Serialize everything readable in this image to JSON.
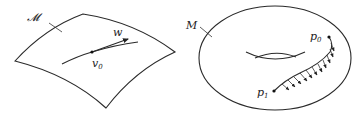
{
  "figure_left": {
    "surface_label": "𝓜",
    "point_label": "v",
    "point_subscript": "0",
    "vector_label": "w"
  },
  "figure_right": {
    "surface_label": "M",
    "start_point_label": "p",
    "start_point_subscript": "0",
    "end_point_label": "p",
    "end_point_subscript": "1"
  },
  "colors": {
    "line": "#2a2a2a",
    "background": "#ffffff"
  }
}
